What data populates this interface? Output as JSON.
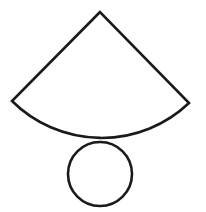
{
  "diagram": {
    "background": "#ffffff",
    "stroke_color": "#1a1a1a",
    "stroke_width": 2.6,
    "sector": {
      "apex": [
        100,
        12
      ],
      "left_end": [
        12,
        101
      ],
      "right_end": [
        189,
        103
      ],
      "radius": 127,
      "arc_lowest_point": [
        100,
        140
      ]
    },
    "circle": {
      "center": [
        100,
        174
      ],
      "radius": 32
    }
  }
}
